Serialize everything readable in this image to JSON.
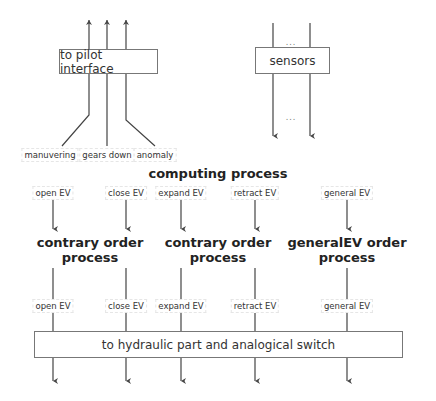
{
  "pilot_box": {
    "label": "to pilot interface"
  },
  "sensors_box": {
    "label": "sensors",
    "ellipsis_top": "...",
    "ellipsis_bottom": "..."
  },
  "pilot_signals": [
    {
      "label": "manuvering"
    },
    {
      "label": "gears down"
    },
    {
      "label": "anomaly"
    }
  ],
  "computing_title": "computing process",
  "input_signals": [
    {
      "label": "open EV"
    },
    {
      "label": "close EV"
    },
    {
      "label": "expand EV"
    },
    {
      "label": "retract EV"
    },
    {
      "label": "general EV"
    }
  ],
  "processes": [
    {
      "line1": "contrary order",
      "line2": "process"
    },
    {
      "line1": "contrary order",
      "line2": "process"
    },
    {
      "line1": "generalEV order",
      "line2": "process"
    }
  ],
  "output_signals": [
    {
      "label": "open EV"
    },
    {
      "label": "close EV"
    },
    {
      "label": "expand EV"
    },
    {
      "label": "retract EV"
    },
    {
      "label": "general EV"
    }
  ],
  "hydraulic_box": {
    "label": "to hydraulic part and analogical switch"
  },
  "colors": {
    "line": "#444444",
    "box_border": "#777777",
    "text": "#222222"
  }
}
